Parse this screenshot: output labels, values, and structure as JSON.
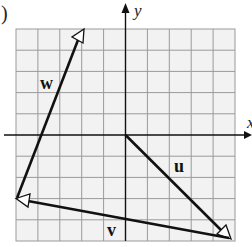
{
  "figure": {
    "panel_label": ")",
    "axes": {
      "x_label": "x",
      "y_label": "y",
      "x_range": [
        -5,
        5
      ],
      "y_range": [
        -5,
        5
      ],
      "grid_step": 1
    },
    "colors": {
      "background": "#ffffff",
      "grid_fill": "#f2f2f2",
      "grid_line": "#9a9a9a",
      "axis": "#111111",
      "vector": "#111111",
      "arrowhead_fill": "#ffffff"
    },
    "vectors": [
      {
        "name": "u",
        "label": "u",
        "from": [
          0,
          0
        ],
        "to": [
          5,
          -5
        ]
      },
      {
        "name": "v",
        "label": "v",
        "from": [
          5,
          -5
        ],
        "to": [
          -5,
          -3
        ]
      },
      {
        "name": "w",
        "label": "w",
        "from": [
          -5,
          -3
        ],
        "to": [
          -2,
          5
        ]
      }
    ]
  }
}
